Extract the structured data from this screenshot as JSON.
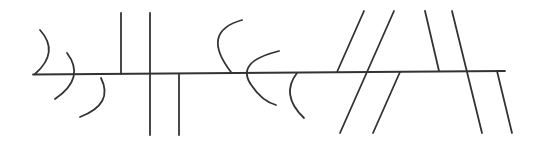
{
  "diagram": {
    "width": 540,
    "height": 141,
    "stroke_color": "#333333",
    "stroke_width": 1.8,
    "background": "#ffffff",
    "baseline": {
      "x1": 33,
      "y1": 74.5,
      "x2": 505,
      "y2": 71
    },
    "arcs": [
      {
        "id": "arc-1",
        "d": "M40,30 Q60,52 35,74"
      },
      {
        "id": "arc-2",
        "d": "M67,53 Q86,78 55,99"
      },
      {
        "id": "arc-3",
        "d": "M101,78 Q114,104 80,117"
      },
      {
        "id": "arc-4",
        "d": "M242,20 Q200,32 231,72"
      },
      {
        "id": "arc-5",
        "d": "M279,51 Q234,62 252,86 Q262,101 276,105"
      },
      {
        "id": "arc-6",
        "d": "M297,73 Q280,95 304,118"
      }
    ],
    "lines": [
      {
        "id": "vertical-1",
        "x1": 121,
        "y1": 13,
        "x2": 121,
        "y2": 74
      },
      {
        "id": "vertical-2",
        "x1": 150,
        "y1": 13,
        "x2": 150,
        "y2": 135
      },
      {
        "id": "vertical-3",
        "x1": 179,
        "y1": 74,
        "x2": 179,
        "y2": 135
      },
      {
        "id": "slant-right-1",
        "x1": 364,
        "y1": 11,
        "x2": 337,
        "y2": 72
      },
      {
        "id": "slant-right-2",
        "x1": 394,
        "y1": 11,
        "x2": 340,
        "y2": 133
      },
      {
        "id": "slant-right-3",
        "x1": 400,
        "y1": 72,
        "x2": 373,
        "y2": 133
      },
      {
        "id": "slant-left-1",
        "x1": 425,
        "y1": 11,
        "x2": 439,
        "y2": 71
      },
      {
        "id": "slant-left-2",
        "x1": 452,
        "y1": 11,
        "x2": 482,
        "y2": 133
      },
      {
        "id": "slant-left-3",
        "x1": 497,
        "y1": 71,
        "x2": 512,
        "y2": 133
      }
    ]
  }
}
